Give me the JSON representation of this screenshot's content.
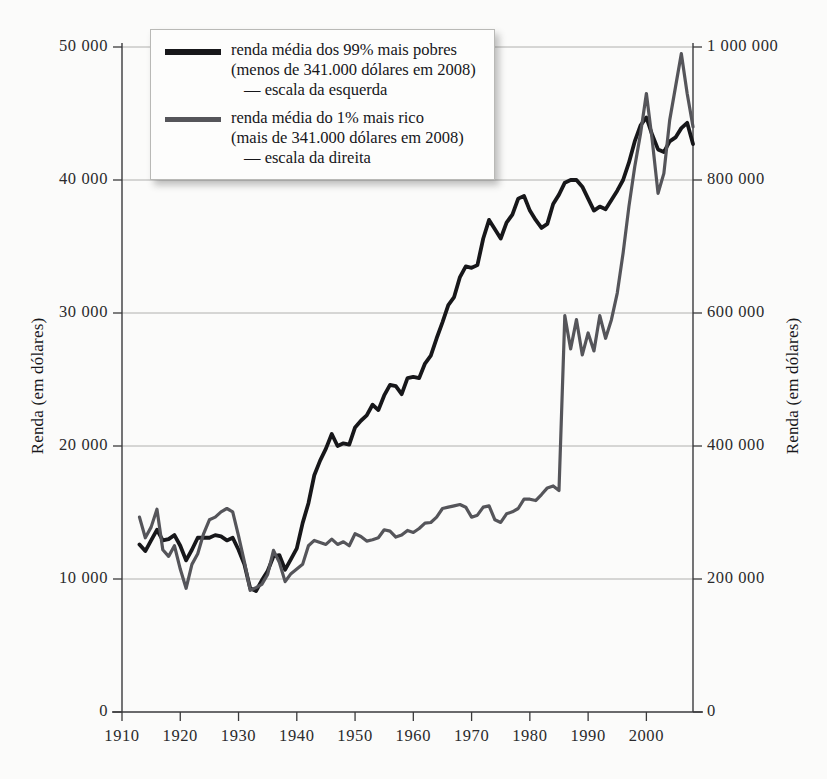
{
  "chart_data": {
    "type": "line",
    "title": "",
    "subtitle": "",
    "xlabel": "",
    "ylabel": "Renda (em dólares)",
    "ylabel_right": "Renda (em dólares)",
    "grid": true,
    "legend_position": "top-left",
    "xlim": [
      1910,
      2008
    ],
    "ylim": [
      0,
      50000
    ],
    "ylim_right": [
      0,
      1000000
    ],
    "xticks": [
      1910,
      1920,
      1930,
      1940,
      1950,
      1960,
      1970,
      1980,
      1990,
      2000
    ],
    "xtick_labels": [
      "1910",
      "1920",
      "1930",
      "1940",
      "1950",
      "1960",
      "1970",
      "1980",
      "1990",
      "2000"
    ],
    "yticks": [
      0,
      10000,
      20000,
      30000,
      40000,
      50000
    ],
    "ytick_labels": [
      "0",
      "10 000",
      "20 000",
      "30 000",
      "40 000",
      "50 000"
    ],
    "yticks_right": [
      0,
      200000,
      400000,
      600000,
      800000,
      1000000
    ],
    "ytick_labels_right": [
      "0",
      "200 000",
      "400 000",
      "600 000",
      "800 000",
      "1 000 000"
    ],
    "colors": {
      "series_99": "#17171a",
      "series_1": "#55555a",
      "grid": "#b0b0ae",
      "axis": "#3a3a3c",
      "background": "#fbfbfa"
    },
    "series": [
      {
        "name": "renda média dos 99% mais pobres",
        "axis": "left",
        "color": "#17171a",
        "x": [
          1913,
          1914,
          1915,
          1916,
          1917,
          1918,
          1919,
          1920,
          1921,
          1922,
          1923,
          1924,
          1925,
          1926,
          1927,
          1928,
          1929,
          1930,
          1931,
          1932,
          1933,
          1934,
          1935,
          1936,
          1937,
          1938,
          1939,
          1940,
          1941,
          1942,
          1943,
          1944,
          1945,
          1946,
          1947,
          1948,
          1949,
          1950,
          1951,
          1952,
          1953,
          1954,
          1955,
          1956,
          1957,
          1958,
          1959,
          1960,
          1961,
          1962,
          1963,
          1964,
          1965,
          1966,
          1967,
          1968,
          1969,
          1970,
          1971,
          1972,
          1973,
          1974,
          1975,
          1976,
          1977,
          1978,
          1979,
          1980,
          1981,
          1982,
          1983,
          1984,
          1985,
          1986,
          1987,
          1988,
          1989,
          1990,
          1991,
          1992,
          1993,
          1994,
          1995,
          1996,
          1997,
          1998,
          1999,
          2000,
          2001,
          2002,
          2003,
          2004,
          2005,
          2006,
          2007,
          2008
        ],
        "y": [
          12600,
          12100,
          12900,
          13700,
          12900,
          13000,
          13300,
          12500,
          11400,
          12200,
          13100,
          13100,
          13100,
          13300,
          13200,
          12900,
          13100,
          12200,
          11100,
          9300,
          9100,
          9900,
          10600,
          11700,
          11800,
          10700,
          11500,
          12300,
          14200,
          15700,
          17800,
          18900,
          19800,
          20900,
          20000,
          20200,
          20100,
          21400,
          21900,
          22300,
          23100,
          22700,
          23800,
          24600,
          24500,
          23900,
          25100,
          25200,
          25100,
          26200,
          26800,
          28100,
          29300,
          30600,
          31200,
          32700,
          33500,
          33400,
          33600,
          35600,
          37000,
          36300,
          35600,
          36800,
          37400,
          38600,
          38800,
          37700,
          37000,
          36400,
          36700,
          38200,
          38900,
          39800,
          40000,
          40000,
          39500,
          38600,
          37700,
          38000,
          37800,
          38500,
          39200,
          40000,
          41300,
          42900,
          44100,
          44700,
          43400,
          42300,
          42100,
          42900,
          43200,
          43900,
          44300,
          42700
        ]
      },
      {
        "name": "renda média do 1% mais rico",
        "axis": "right",
        "color": "#55555a",
        "x": [
          1913,
          1914,
          1915,
          1916,
          1917,
          1918,
          1919,
          1920,
          1921,
          1922,
          1923,
          1924,
          1925,
          1926,
          1927,
          1928,
          1929,
          1930,
          1931,
          1932,
          1933,
          1934,
          1935,
          1936,
          1937,
          1938,
          1939,
          1940,
          1941,
          1942,
          1943,
          1944,
          1945,
          1946,
          1947,
          1948,
          1949,
          1950,
          1951,
          1952,
          1953,
          1954,
          1955,
          1956,
          1957,
          1958,
          1959,
          1960,
          1961,
          1962,
          1963,
          1964,
          1965,
          1966,
          1967,
          1968,
          1969,
          1970,
          1971,
          1972,
          1973,
          1974,
          1975,
          1976,
          1977,
          1978,
          1979,
          1980,
          1981,
          1982,
          1983,
          1984,
          1985,
          1986,
          1987,
          1988,
          1989,
          1990,
          1991,
          1992,
          1993,
          1994,
          1995,
          1996,
          1997,
          1998,
          1999,
          2000,
          2001,
          2002,
          2003,
          2004,
          2005,
          2006,
          2007,
          2008
        ],
        "y": [
          293000,
          262000,
          278000,
          305000,
          244000,
          234000,
          250000,
          215000,
          186000,
          222000,
          238000,
          268000,
          289000,
          293000,
          301000,
          306000,
          301000,
          265000,
          226000,
          183000,
          187000,
          192000,
          207000,
          243000,
          225000,
          196000,
          208000,
          215000,
          222000,
          250000,
          258000,
          255000,
          252000,
          260000,
          252000,
          256000,
          250000,
          268000,
          264000,
          257000,
          259000,
          262000,
          274000,
          272000,
          263000,
          266000,
          273000,
          270000,
          276000,
          284000,
          285000,
          293000,
          306000,
          308000,
          310000,
          312000,
          308000,
          293000,
          296000,
          308000,
          310000,
          289000,
          285000,
          298000,
          301000,
          306000,
          320000,
          320000,
          318000,
          327000,
          337000,
          340000,
          333000,
          596000,
          546000,
          590000,
          537000,
          570000,
          543000,
          596000,
          562000,
          590000,
          630000,
          690000,
          760000,
          820000,
          870000,
          930000,
          860000,
          780000,
          810000,
          890000,
          940000,
          990000,
          930000,
          880000
        ]
      }
    ]
  },
  "legend": {
    "entries": [
      {
        "swatch": "dark",
        "line1": "renda média dos 99% mais pobres",
        "line2": "(menos de 341.000 dólares em 2008)",
        "line3": "— escala da esquerda"
      },
      {
        "swatch": "gray",
        "line1": "renda média do 1% mais rico",
        "line2": "(mais de 341.000 dólares em 2008)",
        "line3": "— escala da direita"
      }
    ]
  }
}
